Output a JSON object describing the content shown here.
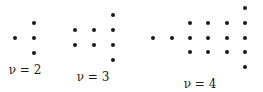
{
  "diagrams": [
    {
      "nu": "2",
      "label": "ν = 2",
      "label_pos": [
        25,
        70
      ],
      "dots": [
        [
          15,
          38
        ],
        [
          34,
          23
        ],
        [
          34,
          38
        ],
        [
          34,
          53
        ]
      ]
    },
    {
      "nu": "3",
      "label": "ν = 3",
      "label_pos": [
        93,
        77
      ],
      "dots": [
        [
          75,
          30
        ],
        [
          75,
          45
        ],
        [
          94,
          30
        ],
        [
          94,
          45
        ],
        [
          113,
          15
        ],
        [
          113,
          30
        ],
        [
          113,
          45
        ],
        [
          113,
          60
        ]
      ]
    },
    {
      "nu": "4",
      "label": "ν = 4",
      "label_pos": [
        200,
        84
      ],
      "dots": [
        [
          153,
          38
        ],
        [
          172,
          38
        ],
        [
          190,
          23
        ],
        [
          190,
          38
        ],
        [
          190,
          52
        ],
        [
          208,
          23
        ],
        [
          208,
          38
        ],
        [
          208,
          52
        ],
        [
          227,
          23
        ],
        [
          227,
          38
        ],
        [
          227,
          52
        ],
        [
          245,
          8
        ],
        [
          245,
          23
        ],
        [
          245,
          38
        ],
        [
          245,
          52
        ],
        [
          245,
          67
        ]
      ]
    }
  ]
}
